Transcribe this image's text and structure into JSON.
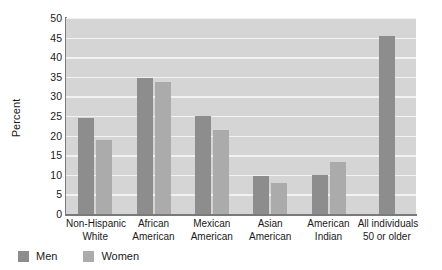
{
  "chart_data": {
    "type": "bar",
    "title": "",
    "xlabel": "",
    "ylabel": "Percent",
    "ylim": [
      0,
      50
    ],
    "ytick_step": 5,
    "yticks": [
      50,
      45,
      40,
      35,
      30,
      25,
      20,
      15,
      10,
      5,
      0
    ],
    "grid": true,
    "legend_position": "bottom-left",
    "categories": [
      "Non-Hispanic White",
      "African American",
      "Mexican American",
      "Asian American",
      "American Indian",
      "All individuals 50 or older"
    ],
    "category_lines": [
      [
        "Non-Hispanic",
        "White"
      ],
      [
        "African",
        "American"
      ],
      [
        "Mexican",
        "American"
      ],
      [
        "Asian",
        "American"
      ],
      [
        "American",
        "Indian"
      ],
      [
        "All individuals",
        "50 or older"
      ]
    ],
    "series": [
      {
        "name": "Men",
        "color": "#8d8d8d",
        "values": [
          24.5,
          34.8,
          25.0,
          9.7,
          10.0,
          45.3
        ]
      },
      {
        "name": "Women",
        "color": "#ababab",
        "values": [
          19.0,
          33.8,
          21.5,
          8.0,
          13.3,
          null
        ]
      }
    ]
  },
  "legend": {
    "items": [
      {
        "label": "Men",
        "color": "#8d8d8d"
      },
      {
        "label": "Women",
        "color": "#ababab"
      }
    ]
  },
  "style": {
    "plot_background": "#d5d5d5",
    "gridline_color": "#f2f2f2",
    "axis_color": "#7a7a7a",
    "text_color": "#1a1a1a"
  }
}
